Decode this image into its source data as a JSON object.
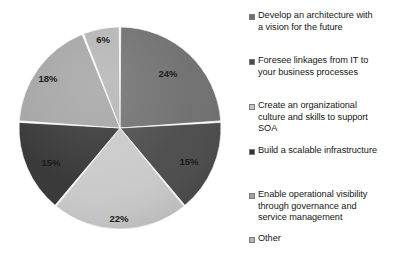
{
  "chart_data": {
    "type": "pie",
    "title": "",
    "subtitle": "",
    "xlabel": "",
    "ylabel": "",
    "grid": false,
    "legend_position": "right",
    "start_angle_deg": 0,
    "direction": "clockwise",
    "categories": [
      "Develop an architecture with a vision for the future",
      "Foresee linkages from IT to your business processes",
      "Create an organizational culture and skills to support SOA",
      "Build a scalable infrastructure",
      "Enable operational visibility through governance and service management",
      "Other"
    ],
    "values": [
      24,
      15,
      22,
      15,
      18,
      6
    ],
    "value_labels": [
      "24%",
      "15%",
      "22%",
      "15%",
      "18%",
      "6%"
    ],
    "colors": [
      "#6e6e6e",
      "#4a4a4a",
      "#c9c9c9",
      "#343434",
      "#a3a3a3",
      "#b4b4b4"
    ],
    "units": "percent",
    "total": 100
  },
  "pie": {
    "center_x": 120,
    "center_y": 128,
    "radius": 101,
    "slices": [
      {
        "name": "develop-architecture",
        "label": "24%",
        "value": 24,
        "color": "#6e6e6e",
        "label_x": 168,
        "label_y": 74
      },
      {
        "name": "foresee-linkages",
        "label": "15%",
        "value": 15,
        "color": "#4a4a4a",
        "label_x": 189,
        "label_y": 162
      },
      {
        "name": "create-culture-skills",
        "label": "22%",
        "value": 22,
        "color": "#c9c9c9",
        "label_x": 119,
        "label_y": 219
      },
      {
        "name": "build-scalable-infrastructure",
        "label": "15%",
        "value": 15,
        "color": "#343434",
        "label_x": 51,
        "label_y": 163
      },
      {
        "name": "enable-operational-visibility",
        "label": "18%",
        "value": 18,
        "color": "#a3a3a3",
        "label_x": 48,
        "label_y": 79
      },
      {
        "name": "other",
        "label": "6%",
        "value": 6,
        "color": "#b4b4b4",
        "label_x": 103,
        "label_y": 40
      }
    ]
  },
  "legend": {
    "items": [
      {
        "name": "develop-architecture",
        "label": "Develop an architecture with\na vision for the future",
        "color": "#6e6e6e",
        "top": 10
      },
      {
        "name": "foresee-linkages",
        "label": "Foresee linkages from IT to\nyour business processes",
        "color": "#4a4a4a",
        "top": 55
      },
      {
        "name": "create-culture-skills",
        "label": "Create an organizational\nculture and skills to support\nSOA",
        "color": "#c9c9c9",
        "top": 100
      },
      {
        "name": "build-scalable-infrastructure",
        "label": "Build a scalable infrastructure",
        "color": "#343434",
        "top": 145
      },
      {
        "name": "enable-operational-visibility",
        "label": "Enable operational visibility\nthrough governance and\nservice management",
        "color": "#a3a3a3",
        "top": 189
      },
      {
        "name": "other",
        "label": "Other",
        "color": "#b4b4b4",
        "top": 233
      }
    ]
  }
}
